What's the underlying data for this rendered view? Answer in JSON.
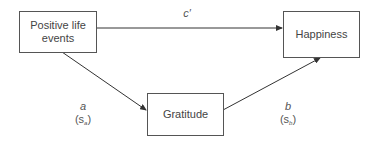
{
  "diagram": {
    "type": "mediation-model",
    "nodes": [
      {
        "id": "x",
        "label_line1": "Positive life",
        "label_line2": "events"
      },
      {
        "id": "y",
        "label": "Happiness"
      },
      {
        "id": "m",
        "label": "Gratitude"
      }
    ],
    "edges": [
      {
        "from": "x",
        "to": "y",
        "coef": "c′"
      },
      {
        "from": "x",
        "to": "m",
        "coef": "a",
        "se_prefix": "(s",
        "se_sub": "a",
        "se_suffix": ")"
      },
      {
        "from": "m",
        "to": "y",
        "coef": "b",
        "se_prefix": "(s",
        "se_sub": "b",
        "se_suffix": ")"
      }
    ],
    "colors": {
      "line": "#333333",
      "box_border": "#555555",
      "text": "#444444"
    }
  }
}
